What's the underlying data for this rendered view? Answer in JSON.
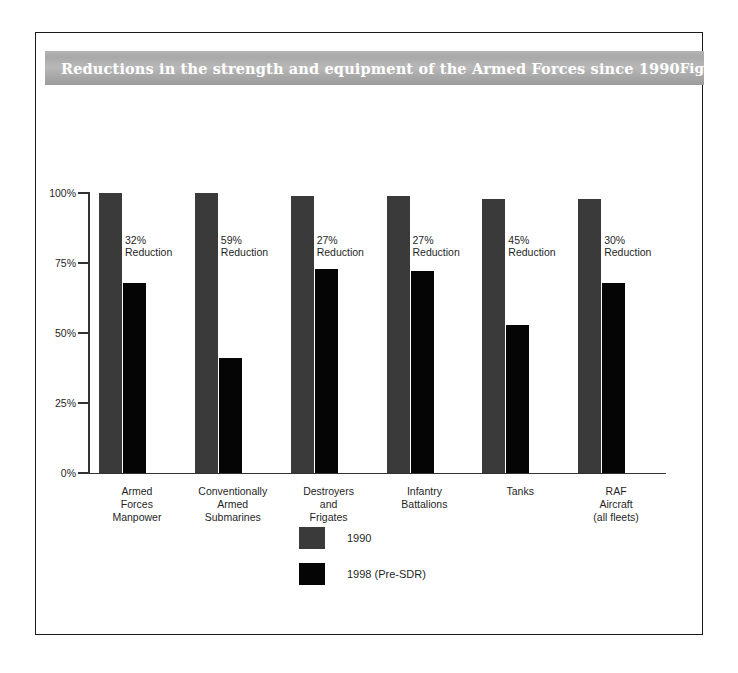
{
  "figure": {
    "title": "Reductions in the strength and equipment of the Armed Forces since 1990",
    "figure_number": "Figure 1"
  },
  "colors": {
    "series_1990": "#3a3a3a",
    "series_1998": "#050505",
    "title_band_gray": "#b0b0b0",
    "title_text": "#ffffff",
    "frame": "#1a1a1a",
    "axis": "#333333"
  },
  "chart_data": {
    "type": "bar",
    "title": "Reductions in the strength and equipment of the Armed Forces since 1990",
    "xlabel": "",
    "ylabel": "",
    "ylim": [
      0,
      100
    ],
    "yticks": [
      0,
      25,
      50,
      75,
      100
    ],
    "ytick_labels": [
      "0%",
      "25%",
      "50%",
      "75%",
      "100%"
    ],
    "grid": false,
    "legend_position": "bottom-center",
    "categories": [
      "Armed\nForces\nManpower",
      "Conventionally\nArmed\nSubmarines",
      "Destroyers\nand\nFrigates",
      "Infantry\nBattalions",
      "Tanks",
      "RAF\nAircraft\n(all fleets)"
    ],
    "category_labels": [
      [
        "Armed",
        "Forces",
        "Manpower"
      ],
      [
        "Conventionally",
        "Armed",
        "Submarines"
      ],
      [
        "Destroyers",
        "and",
        "Frigates"
      ],
      [
        "Infantry",
        "Battalions"
      ],
      [
        "Tanks"
      ],
      [
        "RAF",
        "Aircraft",
        "(all fleets)"
      ]
    ],
    "series": [
      {
        "name": "1990",
        "values": [
          100,
          100,
          99,
          99,
          98,
          98
        ]
      },
      {
        "name": "1998 (Pre-SDR)",
        "values": [
          68,
          41,
          73,
          72,
          53,
          68
        ]
      }
    ],
    "annotations": [
      {
        "category": "Armed Forces Manpower",
        "percent": "32%",
        "text": "Reduction"
      },
      {
        "category": "Conventionally Armed Submarines",
        "percent": "59%",
        "text": "Reduction"
      },
      {
        "category": "Destroyers and Frigates",
        "percent": "27%",
        "text": "Reduction"
      },
      {
        "category": "Infantry Battalions",
        "percent": "27%",
        "text": "Reduction"
      },
      {
        "category": "Tanks",
        "percent": "45%",
        "text": "Reduction"
      },
      {
        "category": "RAF Aircraft (all fleets)",
        "percent": "30%",
        "text": "Reduction"
      }
    ]
  },
  "legend": {
    "entries": [
      {
        "label": "1990",
        "color": "#3a3a3a"
      },
      {
        "label": "1998 (Pre-SDR)",
        "color": "#050505"
      }
    ]
  }
}
